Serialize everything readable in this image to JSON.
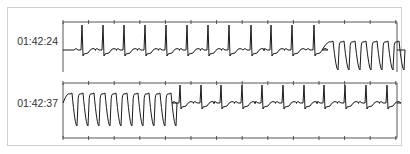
{
  "chart_data": {
    "type": "line",
    "title": "",
    "xlabel": "",
    "ylabel": "",
    "grid": false,
    "tick_spacing_px": 25.6,
    "ticks_per_axis": 14,
    "strips": [
      {
        "timestamp": "01:42:24",
        "segments": [
          {
            "rhythm": "sinus",
            "x_start": 63,
            "x_end": 322,
            "beat_x": [
              82,
              103,
              124,
              145,
              166,
              187,
              208,
              229,
              251,
              271,
              292,
              314
            ]
          },
          {
            "rhythm": "wide-complex tachycardia",
            "x_start": 322,
            "x_end": 397,
            "beat_x": [
              330,
              341,
              352,
              363,
              374,
              385,
              396
            ]
          }
        ]
      },
      {
        "timestamp": "01:42:37",
        "segments": [
          {
            "rhythm": "wide-complex tachycardia",
            "x_start": 63,
            "x_end": 177,
            "beat_x": [
              69,
              80,
              91,
              102,
              113,
              124,
              135,
              146,
              157,
              168
            ]
          },
          {
            "rhythm": "sinus",
            "x_start": 177,
            "x_end": 397,
            "beat_x": [
              180,
              201,
              221,
              242,
              262,
              283,
              304,
              324,
              345,
              366,
              387
            ]
          }
        ]
      }
    ]
  },
  "strips": [
    {
      "label": "01:42:24"
    },
    {
      "label": "01:42:37"
    }
  ],
  "colors": {
    "trace": "#1a1a1a",
    "axis": "#444444",
    "frame": "#cfcfcf"
  }
}
